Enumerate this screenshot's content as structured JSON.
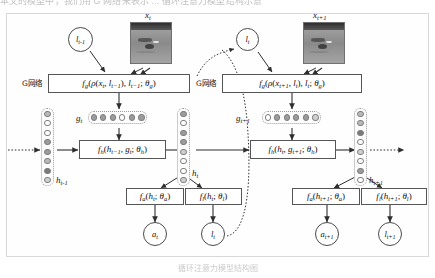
{
  "page": {
    "top_clipped_text": "本文的模型中，我们用 G 网络来表示 ...  循环注意力模型结构示意",
    "bottom_caption": "循环注意力模型结构图"
  },
  "diagram": {
    "network_label_left": "G网络",
    "network_label_right": "G网络",
    "inputs": {
      "image_t_label": "x",
      "image_t_sub": "t",
      "image_t1_label": "x",
      "image_t1_sub": "t+1"
    },
    "glimpse_nodes": [
      {
        "name": "l",
        "sub": "t-1"
      },
      {
        "name": "l",
        "sub": "t"
      }
    ],
    "boxes": {
      "g_net_t": "f g ( ρ ( x t , l t−1 ) , l t−1 ; θ g )",
      "g_net_t1": "f g ( ρ ( x t+1 , l t ) , l t ; θ g )",
      "f_h_t": "f h ( h t−1 , g t ; θ h )",
      "f_h_t1": "f h ( h t , g t+1 ; θ h )",
      "f_a_t": "f a ( h t ; θ a )",
      "f_l_t": "f l ( h t ; θ l )",
      "f_a_t1": "f a ( h t+1 ; θ a )",
      "f_l_t1": "f l ( h t+1 ; θ l )"
    },
    "state_labels": {
      "h_prev": {
        "name": "h",
        "sub": "t-1"
      },
      "h_t": {
        "name": "h",
        "sub": "t"
      },
      "h_next": {
        "name": "h",
        "sub": "t+1"
      }
    },
    "glimpse_vectors": {
      "g_t_label": {
        "name": "g",
        "sub": "t"
      },
      "g_t_fills": [
        "f2",
        "f2",
        "f2",
        "f0",
        "f2",
        "f2"
      ],
      "g_t1_label": {
        "name": "g",
        "sub": "t+1"
      },
      "g_t1_fills": [
        "f0",
        "f2",
        "f2",
        "f2",
        "f2",
        "f4"
      ]
    },
    "hidden_columns": {
      "h_prev_fills": [
        "f1",
        "f0",
        "f0",
        "f2",
        "f2",
        "f1",
        "f3",
        "f4"
      ],
      "h_t_fills": [
        "f2",
        "f0",
        "f2",
        "f2",
        "f4",
        "f0",
        "f0",
        "f4"
      ],
      "h_next_fills": [
        "f1",
        "f1",
        "f3",
        "f0",
        "f4",
        "f0",
        "f2",
        "f0"
      ]
    },
    "outputs": [
      {
        "name": "a",
        "sub": "t"
      },
      {
        "name": "l",
        "sub": "t"
      },
      {
        "name": "a",
        "sub": "t+1"
      },
      {
        "name": "l",
        "sub": "t+1"
      }
    ],
    "colors": {
      "stroke": "#3d3d3d",
      "box_border": "#555555",
      "unit_border": "#7d7d7d",
      "panel_border": "#d8d8d8"
    }
  }
}
